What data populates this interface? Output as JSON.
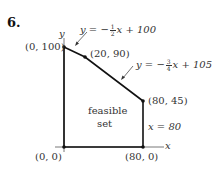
{
  "problem": {
    "number": "6."
  },
  "axes": {
    "x_label": "x",
    "y_label": "y"
  },
  "region": {
    "label_line1": "feasible",
    "label_line2": "set"
  },
  "points": [
    {
      "label": "(0, 100)",
      "x": 0,
      "y": 100
    },
    {
      "label": "(20, 90)",
      "x": 20,
      "y": 90
    },
    {
      "label": "(80, 45)",
      "x": 80,
      "y": 45
    },
    {
      "label": "(0, 0)",
      "x": 0,
      "y": 0
    },
    {
      "label": "(80, 0)",
      "x": 80,
      "y": 0
    }
  ],
  "lines": {
    "line1": {
      "lhs": "y = −",
      "num": "1",
      "den": "2",
      "rhs": "x + 100"
    },
    "line2": {
      "lhs": "y = −",
      "num": "3",
      "den": "4",
      "rhs": "x + 105"
    },
    "line3": {
      "text": "x = 80"
    }
  },
  "colors": {
    "stroke": "#111111",
    "text": "#333333",
    "background": "#ffffff"
  }
}
